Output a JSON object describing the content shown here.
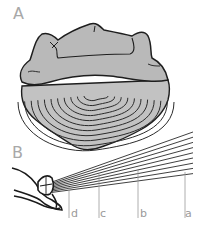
{
  "figure": {
    "panels": [
      {
        "id": "A",
        "label": "A",
        "subject": "anterior view of a shell with a flat, lobed upper plate over concentrically ridged body"
      },
      {
        "id": "B",
        "label": "B",
        "subject": "lateral view of a hinge joint with a fan of lines radiating to the right"
      }
    ],
    "markers": [
      {
        "id": "d",
        "label": "d"
      },
      {
        "id": "c",
        "label": "c"
      },
      {
        "id": "b",
        "label": "b"
      },
      {
        "id": "a",
        "label": "a"
      }
    ],
    "fan_line_count": 9,
    "colors": {
      "shell_fill": "#b9b9b9",
      "outline": "#1e1e1e",
      "label": "#a8a8a8",
      "marker_line": "#9a9a9a"
    }
  }
}
